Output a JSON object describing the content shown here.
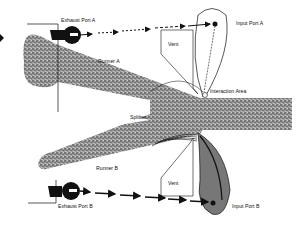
{
  "diagram": {
    "labels": {
      "exhaust_port_a": "Exhaust Port  A",
      "input_port_a": "Input Port  A",
      "vent_a": "Vent",
      "runner_a": "Runner A",
      "interaction_area": "Interaction Area",
      "splitter": "Splitter",
      "runner_b": "Runner B",
      "vent_b": "Vent",
      "exhaust_port_b": "Exhaust Port B",
      "input_port_b": "Input Port B"
    },
    "colors": {
      "background": "#ffffff",
      "ink": "#111111",
      "stipple": "#8a8a8a"
    }
  }
}
